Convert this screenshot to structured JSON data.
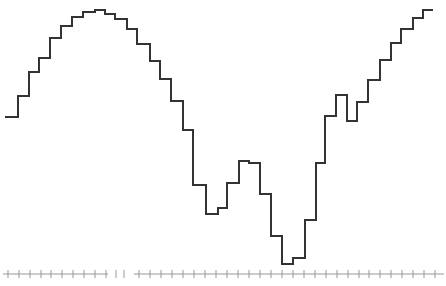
{
  "chart_data": {
    "type": "line",
    "style": "step",
    "title": "",
    "xlabel": "",
    "ylabel": "",
    "grid": false,
    "legend": null,
    "line_color": "#333333",
    "axis_color": "#999999",
    "step_edges_px": [
      5,
      18,
      29,
      39,
      50,
      61,
      72,
      83,
      95,
      105,
      115,
      127,
      137,
      150,
      160,
      171,
      183,
      193,
      206,
      218,
      227,
      239,
      249,
      260,
      271,
      282,
      293,
      305,
      316,
      325,
      336,
      347,
      357,
      368,
      380,
      391,
      401,
      413,
      423,
      433
    ],
    "y_px": [
      117,
      96,
      72,
      58,
      38,
      26,
      17,
      12,
      10,
      14,
      19,
      29,
      44,
      61,
      79,
      101,
      130,
      185,
      214,
      208,
      183,
      161,
      163,
      194,
      236,
      264,
      258,
      220,
      163,
      116,
      95,
      121,
      102,
      80,
      60,
      43,
      29,
      18,
      10
    ],
    "x": [
      1,
      2,
      3,
      4,
      5,
      6,
      7,
      8,
      9,
      10,
      11,
      12,
      13,
      14,
      15,
      16,
      17,
      18,
      19,
      20,
      21,
      22,
      23,
      24,
      25,
      26,
      27,
      28,
      29,
      30,
      31,
      32,
      33,
      34,
      35,
      36,
      37,
      38,
      39
    ],
    "values": [
      157,
      178,
      202,
      216,
      236,
      248,
      257,
      262,
      264,
      260,
      255,
      245,
      230,
      213,
      195,
      173,
      144,
      89,
      60,
      66,
      91,
      113,
      111,
      80,
      38,
      10,
      16,
      54,
      111,
      158,
      179,
      153,
      172,
      194,
      214,
      231,
      245,
      256,
      264
    ],
    "axis": {
      "y_px": 274,
      "segments": [
        [
          3,
          108
        ],
        [
          134,
          444
        ]
      ],
      "tick_x_px": [
        8,
        19,
        30,
        41,
        51,
        62,
        73,
        84,
        95,
        106,
        116,
        124,
        139,
        150,
        161,
        172,
        183,
        194,
        205,
        216,
        227,
        238,
        249,
        260,
        271,
        282,
        293,
        304,
        315,
        326,
        337,
        348,
        359,
        369,
        380,
        391,
        402,
        413,
        424,
        435
      ],
      "tick_labels": []
    }
  }
}
